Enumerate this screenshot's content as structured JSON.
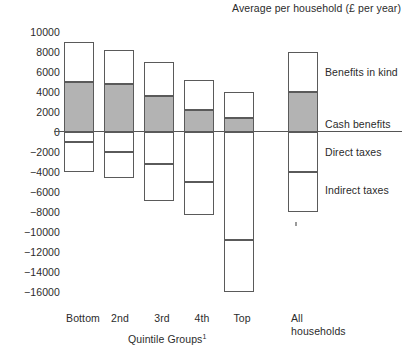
{
  "chart": {
    "title": "Average per household (£ per year)",
    "x_axis_title": "Quintile Groups",
    "x_axis_title_footnote": "1"
  },
  "y_axis": {
    "ticks": [
      "10000",
      "8000",
      "6000",
      "4000",
      "2000",
      "0",
      "-2000",
      "-4000",
      "-6000",
      "-8000",
      "-10000",
      "-12000",
      "-14000",
      "-16000"
    ]
  },
  "x_axis": {
    "categories": [
      "Bottom",
      "2nd",
      "3rd",
      "4th",
      "Top",
      "All households"
    ]
  },
  "legend": {
    "items": [
      {
        "label": "Benefits in kind",
        "color": "#ffffff"
      },
      {
        "label": "Cash benefits",
        "color": "#b3b3b3"
      },
      {
        "label": "Direct taxes",
        "color": "#ffffff"
      },
      {
        "label": "Indirect taxes",
        "color": "#ffffff"
      }
    ]
  },
  "chart_data": {
    "type": "bar",
    "title": "Average per household (£ per year)",
    "xlabel": "Quintile Groups",
    "ylabel": "",
    "ylim": [
      -16000,
      10000
    ],
    "ytick_step": 2000,
    "grid": false,
    "legend_position": "right",
    "stacked": true,
    "categories": [
      "Bottom",
      "2nd",
      "3rd",
      "4th",
      "Top",
      "All households"
    ],
    "series": [
      {
        "name": "Benefits in kind",
        "color": "#ffffff",
        "values": [
          4000,
          3400,
          3400,
          3000,
          2600,
          4000
        ]
      },
      {
        "name": "Cash benefits",
        "color": "#b3b3b3",
        "values": [
          5000,
          4800,
          3600,
          2200,
          1400,
          4000
        ]
      },
      {
        "name": "Direct taxes",
        "color": "#ffffff",
        "values": [
          -1000,
          -2000,
          -3200,
          -5000,
          -10800,
          -4000
        ]
      },
      {
        "name": "Indirect taxes",
        "color": "#ffffff",
        "values": [
          -3000,
          -2600,
          -3700,
          -3300,
          -5200,
          -4000
        ]
      }
    ],
    "segment_bounds": [
      {
        "category": "Bottom",
        "top": 9000,
        "cash_top": 5000,
        "zero": 0,
        "direct_bottom": -1000,
        "bottom": -4000
      },
      {
        "category": "2nd",
        "top": 8200,
        "cash_top": 4800,
        "zero": 0,
        "direct_bottom": -2000,
        "bottom": -4600
      },
      {
        "category": "3rd",
        "top": 7000,
        "cash_top": 3600,
        "zero": 0,
        "direct_bottom": -3200,
        "bottom": -6900
      },
      {
        "category": "4th",
        "top": 5200,
        "cash_top": 2200,
        "zero": 0,
        "direct_bottom": -5000,
        "bottom": -8300
      },
      {
        "category": "Top",
        "top": 4000,
        "cash_top": 1400,
        "zero": 0,
        "direct_bottom": -10800,
        "bottom": -16000
      },
      {
        "category": "All households",
        "top": 8000,
        "cash_top": 4000,
        "zero": 0,
        "direct_bottom": -4000,
        "bottom": -8000
      }
    ]
  }
}
